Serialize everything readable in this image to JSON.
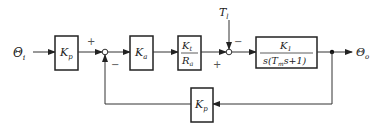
{
  "diagram": {
    "type": "control-system block diagram",
    "input": {
      "symbol": "Θ",
      "sub": "i"
    },
    "output": {
      "symbol": "Θ",
      "sub": "o"
    },
    "disturbance": {
      "symbol": "T",
      "sub": "l"
    },
    "blocks": [
      {
        "id": "kp-forward",
        "num": "K",
        "num_sub": "p"
      },
      {
        "id": "ka",
        "num": "K",
        "num_sub": "a"
      },
      {
        "id": "kt-ra",
        "num": "K",
        "num_sub": "t",
        "den": "R",
        "den_sub": "a"
      },
      {
        "id": "plant",
        "num": "K",
        "num_sub": "1",
        "den_pre": "s(T",
        "den_sub": "m",
        "den_post": "s+1)"
      },
      {
        "id": "kp-feedback",
        "num": "K",
        "num_sub": "p"
      }
    ],
    "junction1": {
      "plus": "+",
      "minus": "−"
    },
    "junction2": {
      "plus": "+",
      "minus": "−"
    }
  }
}
